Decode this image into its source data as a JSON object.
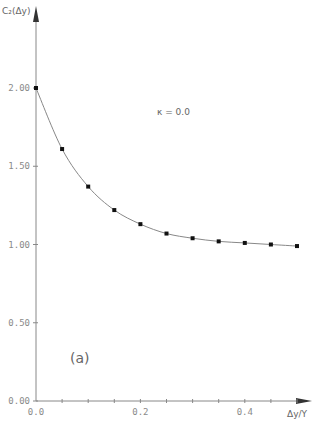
{
  "chart_data": {
    "type": "line",
    "title": "",
    "xlabel": "Δy/Y",
    "ylabel": "C₂(Δy)",
    "xlim": [
      0.0,
      0.52
    ],
    "ylim": [
      0.0,
      2.2
    ],
    "x_ticks": [
      "0.0",
      "0.2",
      "0.4"
    ],
    "y_ticks": [
      "0.00",
      "0.50",
      "1.00",
      "1.50",
      "2.00"
    ],
    "grid": false,
    "legend": null,
    "annotations": [
      "κ = 0.0",
      "(a)"
    ],
    "series": [
      {
        "name": "C2",
        "style": "line-with-square-markers",
        "x": [
          0.0,
          0.05,
          0.1,
          0.15,
          0.2,
          0.25,
          0.3,
          0.35,
          0.4,
          0.45,
          0.5
        ],
        "values": [
          2.0,
          1.61,
          1.37,
          1.22,
          1.13,
          1.07,
          1.04,
          1.02,
          1.01,
          1.0,
          0.99
        ]
      }
    ]
  },
  "labels": {
    "ylabel": "C₂(Δy)",
    "xlabel": "Δy/Y",
    "annotation": "κ = 0.0",
    "panel": "(a)"
  }
}
